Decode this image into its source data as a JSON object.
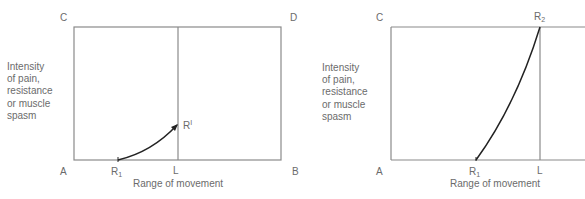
{
  "diagrams": [
    {
      "id": "left",
      "corner_labels": {
        "top_left": "C",
        "top_right": "D",
        "bottom_left": "A",
        "bottom_right": "B"
      },
      "y_axis_label": [
        "Intensity",
        "of pain,",
        "resistance",
        "or muscle",
        "spasm"
      ],
      "x_axis_label": "Range of movement",
      "points": {
        "r1": {
          "base": "R",
          "sub": "1"
        },
        "l": "L",
        "r_prime": {
          "base": "R",
          "sup": "I"
        }
      },
      "curve": "concave-up arc from R1 on baseline to R' on L line (low intensity), arrowhead at R'"
    },
    {
      "id": "right",
      "corner_labels": {
        "top_left": "C",
        "bottom_left": "A"
      },
      "y_axis_label": [
        "Intensity",
        "of pain,",
        "resistance",
        "or muscle",
        "spasm"
      ],
      "x_axis_label": "Range of movement",
      "points": {
        "r1": {
          "base": "R",
          "sub": "1"
        },
        "l": "L",
        "r2": {
          "base": "R",
          "sub": "2"
        }
      },
      "curve": "steep curve from R1 on baseline up to R2 at top of L line (maximum intensity)"
    }
  ],
  "colors": {
    "frame": "#8a8a8a",
    "curve": "#222222",
    "text": "#6b6b6b"
  }
}
